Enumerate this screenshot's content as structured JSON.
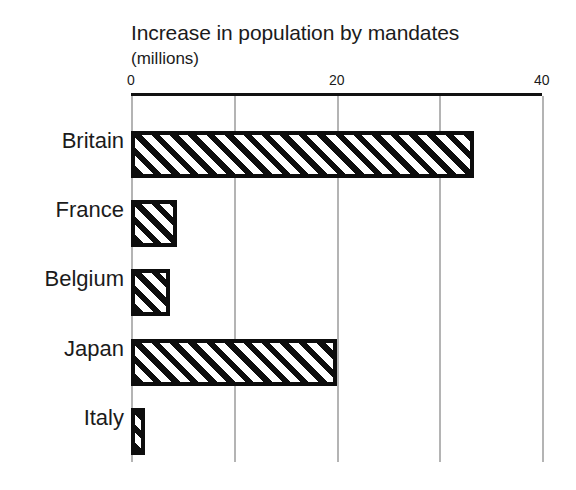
{
  "chart_data": {
    "type": "bar",
    "orientation": "horizontal",
    "title": "Increase in population by mandates",
    "subtitle": "(millions)",
    "xlabel": "",
    "ylabel": "",
    "categories": [
      "Britain",
      "France",
      "Belgium",
      "Japan",
      "Italy"
    ],
    "values": [
      33.4,
      4.5,
      3.8,
      20.0,
      1.4
    ],
    "xlim": [
      0,
      40
    ],
    "xticks": [
      0,
      20,
      40
    ],
    "xtick_labels": [
      "0",
      "20",
      "40"
    ],
    "gridlines_at": [
      0,
      10,
      20,
      30,
      40
    ],
    "grid": true,
    "legend": null,
    "series": [
      {
        "name": "Increase in population by mandates",
        "values": [
          33.4,
          4.5,
          3.8,
          20.0,
          1.4
        ]
      }
    ],
    "bar_style": {
      "fill": "diagonal-hatch",
      "hatch_color": "#0d0d0d",
      "background_color": "#ffffff",
      "border_color": "#0d0d0d"
    },
    "colors": {
      "background": "#ffffff",
      "text": "#1b1b1b",
      "axis": "#111111",
      "grid": "#b4b4b4"
    }
  }
}
